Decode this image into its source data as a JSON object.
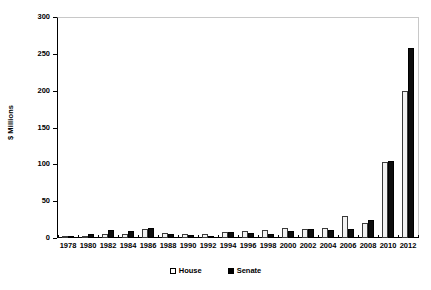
{
  "chart_data": {
    "type": "bar",
    "title": "",
    "xlabel": "",
    "ylabel": "$ Millions",
    "ylim": [
      0,
      300
    ],
    "yticks": [
      0,
      50,
      100,
      150,
      200,
      250,
      300
    ],
    "grid": false,
    "legend_position": "bottom-center",
    "categories": [
      "1978",
      "1980",
      "1982",
      "1984",
      "1986",
      "1988",
      "1990",
      "1992",
      "1994",
      "1996",
      "1998",
      "2000",
      "2002",
      "2004",
      "2006",
      "2008",
      "2010",
      "2012"
    ],
    "series": [
      {
        "name": "House",
        "color": "#f2f2f2",
        "values": [
          1,
          2,
          5,
          6,
          12,
          7,
          5,
          6,
          8,
          9,
          11,
          14,
          12,
          13,
          30,
          21,
          103,
          199
        ]
      },
      {
        "name": "Senate",
        "color": "#0d0d0d",
        "values": [
          1,
          6,
          11,
          9,
          14,
          5,
          4,
          3,
          8,
          7,
          6,
          9,
          12,
          11,
          12,
          25,
          104,
          258
        ]
      }
    ]
  },
  "legend": {
    "items": [
      {
        "label": "House",
        "swatch": "open-square"
      },
      {
        "label": "Senate",
        "swatch": "filled-square"
      }
    ]
  }
}
